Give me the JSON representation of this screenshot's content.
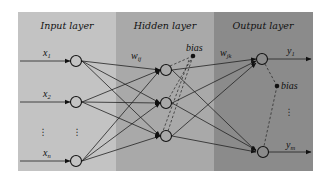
{
  "diagram": {
    "type": "neural-network-architecture",
    "layers": [
      {
        "name": "Input layer",
        "color": "#c3c3c3",
        "nodes": [
          "x1",
          "x2",
          "xn"
        ]
      },
      {
        "name": "Hidden layer",
        "color": "#a9a9a9",
        "nodes": [
          "h1",
          "h2",
          "h3"
        ],
        "bias_label": "bias"
      },
      {
        "name": "Output layer",
        "color": "#8b8b8b",
        "nodes": [
          "y1",
          "ym"
        ],
        "bias_label": "bias"
      }
    ],
    "labels": {
      "input_title": "Input layer",
      "hidden_title": "Hidden layer",
      "output_title": "Output layer",
      "x1_base": "x",
      "x1_sub": "1",
      "x2_base": "x",
      "x2_sub": "2",
      "xn_base": "x",
      "xn_sub": "n",
      "wij_base": "w",
      "wij_sub": "ij",
      "wjk_base": "w",
      "wjk_sub": "jk",
      "y1_base": "y",
      "y1_sub": "1",
      "ym_base": "y",
      "ym_sub": "m",
      "hidden_bias": "bias",
      "output_bias": "bias",
      "vdots": "⋮"
    },
    "connections": "fully connected input→hidden→output; dashed lines from bias nodes"
  }
}
